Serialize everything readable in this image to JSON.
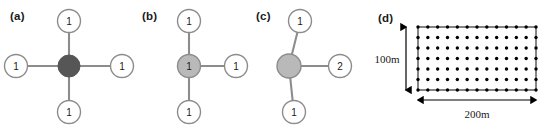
{
  "figure": {
    "background": "#ffffff",
    "width": 552,
    "height": 126
  },
  "style": {
    "edge_color": "#8c8c8c",
    "node_stroke": "#8c8c8c",
    "node_fill_white": "#ffffff",
    "hub_dark_fill": "#565656",
    "hub_light_fill": "#b9b9b9",
    "grid_color": "#000000",
    "text_color": "#1a1a1a"
  },
  "panels": [
    {
      "id": "a",
      "label": "(a)",
      "type": "star-graph",
      "hub": {
        "fill_key": "hub_dark_fill",
        "label": "",
        "radius": 11
      },
      "leaves": [
        {
          "position": "top",
          "label": "1"
        },
        {
          "position": "right",
          "label": "1"
        },
        {
          "position": "bottom",
          "label": "1"
        },
        {
          "position": "left",
          "label": "1"
        }
      ]
    },
    {
      "id": "b",
      "label": "(b)",
      "type": "star-graph",
      "hub": {
        "fill_key": "hub_light_fill",
        "label": "1",
        "radius": 11
      },
      "leaves": [
        {
          "position": "top",
          "label": "1"
        },
        {
          "position": "right",
          "label": "1"
        },
        {
          "position": "bottom",
          "label": "1"
        }
      ]
    },
    {
      "id": "c",
      "label": "(c)",
      "type": "star-graph",
      "hub": {
        "fill_key": "hub_light_fill",
        "label": "",
        "radius": 11
      },
      "leaves": [
        {
          "position": "top",
          "label": "1"
        },
        {
          "position": "right",
          "label": "2"
        },
        {
          "position": "bottom",
          "label": "1"
        }
      ]
    },
    {
      "id": "d",
      "label": "(d)",
      "type": "node-deployment-area",
      "area": {
        "width_label": "200m",
        "height_label": "100m",
        "border_dots_horizontal": 13,
        "border_dots_vertical": 7,
        "interior_rows": 5,
        "interior_cols": 11
      }
    }
  ]
}
